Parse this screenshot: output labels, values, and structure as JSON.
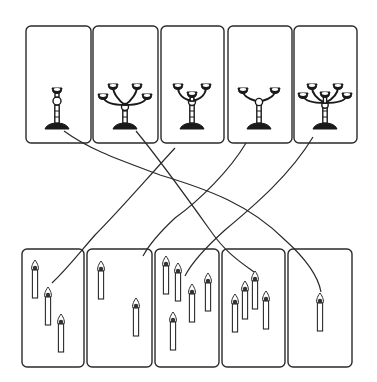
{
  "diagram": {
    "type": "matching-puzzle",
    "colors": {
      "ink": "#1a1a1a",
      "background": "#ffffff"
    },
    "top_row": [
      {
        "id": "candlestick-1",
        "arms": 1
      },
      {
        "id": "candlestick-2",
        "arms": 4
      },
      {
        "id": "candlestick-3",
        "arms": 3
      },
      {
        "id": "candlestick-4",
        "arms": 2
      },
      {
        "id": "candlestick-5",
        "arms": 5
      }
    ],
    "bottom_row": [
      {
        "id": "candles-1",
        "count": 3
      },
      {
        "id": "candles-2",
        "count": 2
      },
      {
        "id": "candles-3",
        "count": 5
      },
      {
        "id": "candles-4",
        "count": 4
      },
      {
        "id": "candles-5",
        "count": 1
      }
    ],
    "connections": [
      {
        "from": "candlestick-1",
        "to": "candles-5"
      },
      {
        "from": "candlestick-2",
        "to": "candles-4"
      },
      {
        "from": "candlestick-3",
        "to": "candles-1"
      },
      {
        "from": "candlestick-4",
        "to": "candles-2"
      },
      {
        "from": "candlestick-5",
        "to": "candles-3"
      }
    ]
  }
}
